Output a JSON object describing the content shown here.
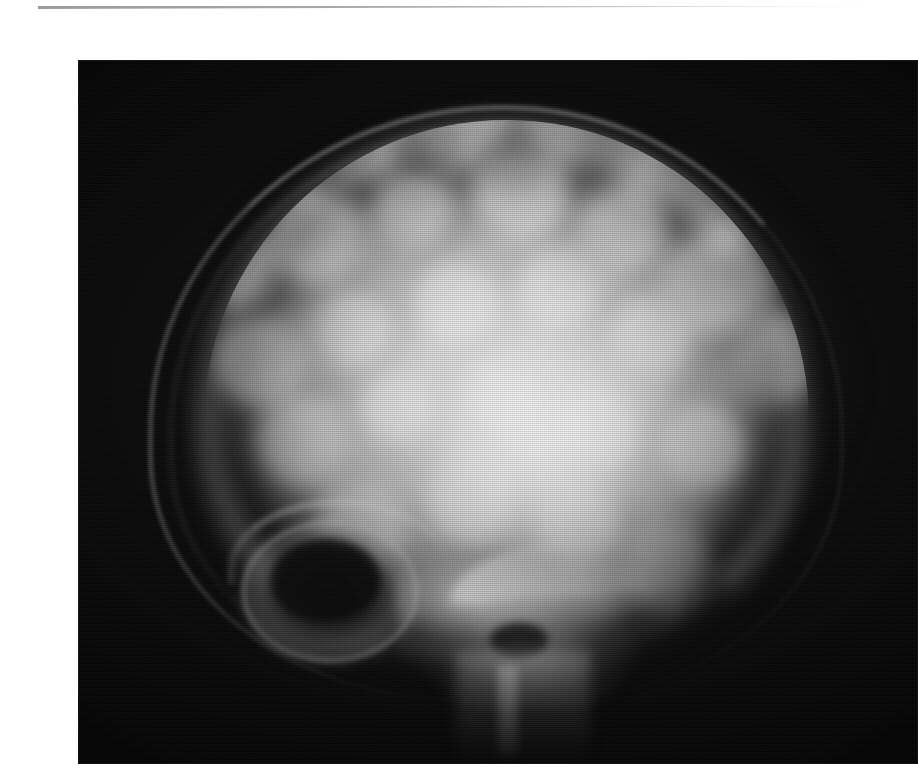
{
  "page": {
    "background_color": "#ffffff",
    "width": 908,
    "height": 782,
    "caption": ""
  },
  "top_rule": {
    "color": "#9a9a9a",
    "label": ""
  },
  "figure": {
    "kind": "radiograph",
    "modality": "X-ray",
    "view": "lateral skull",
    "background_color": "#050505",
    "bone_color": "#e6e6e6",
    "air_color": "#0a0a0a",
    "regions": [
      {
        "name": "outer-table-arc",
        "label": "Outer table / scalp line"
      },
      {
        "name": "calvarium",
        "label": "Thickened calvarium"
      },
      {
        "name": "cotton-wool",
        "label": "Cotton-wool opacities"
      },
      {
        "name": "diploe-band",
        "label": "Widened diploic space"
      },
      {
        "name": "dense-core",
        "label": "Dense sclerotic centre"
      },
      {
        "name": "orbit",
        "label": "Orbit"
      },
      {
        "name": "skull-base",
        "label": "Skull base / sphenoid"
      },
      {
        "name": "petrous-ridge",
        "label": "Petrous ridge"
      },
      {
        "name": "sella",
        "label": "Sella turcica"
      },
      {
        "name": "midface",
        "label": "Midface / nasal shadow"
      },
      {
        "name": "occipital",
        "label": "Occipital region"
      }
    ]
  }
}
